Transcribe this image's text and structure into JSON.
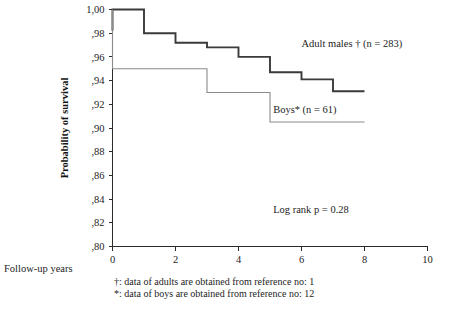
{
  "chart_data": {
    "type": "line",
    "subtype": "kaplan-meier-step",
    "title": "",
    "xlabel": "Follow-up years",
    "ylabel": "Probability of survival",
    "xlim": [
      0,
      10
    ],
    "ylim": [
      0.8,
      1.0
    ],
    "grid": false,
    "legend_position": "inline-annotations",
    "x_ticks": [
      0,
      2,
      4,
      6,
      8,
      10
    ],
    "x_tick_labels": [
      "0",
      "2",
      "4",
      "6",
      "8",
      "10"
    ],
    "y_ticks": [
      0.8,
      0.82,
      0.84,
      0.86,
      0.88,
      0.9,
      0.92,
      0.94,
      0.96,
      0.98,
      1.0
    ],
    "y_tick_labels": [
      ",80",
      ",82",
      ",84",
      ",86",
      ",88",
      ",90",
      ",92",
      ",94",
      ",96",
      ",98",
      "1,00"
    ],
    "decimal_separator": "comma",
    "series": [
      {
        "name": "Adult males",
        "label": "Adult males † (n = 283)",
        "n": 283,
        "footnote_marker": "†",
        "color": "#3a3a3a",
        "line_width": 1.9,
        "points": [
          {
            "x": 0.0,
            "y": 0.982
          },
          {
            "x": 0.0,
            "y": 1.0
          },
          {
            "x": 1.0,
            "y": 1.0
          },
          {
            "x": 1.0,
            "y": 0.98
          },
          {
            "x": 2.0,
            "y": 0.98
          },
          {
            "x": 2.0,
            "y": 0.972
          },
          {
            "x": 3.0,
            "y": 0.972
          },
          {
            "x": 3.0,
            "y": 0.968
          },
          {
            "x": 4.0,
            "y": 0.968
          },
          {
            "x": 4.0,
            "y": 0.96
          },
          {
            "x": 5.0,
            "y": 0.96
          },
          {
            "x": 5.0,
            "y": 0.947
          },
          {
            "x": 6.0,
            "y": 0.947
          },
          {
            "x": 6.0,
            "y": 0.941
          },
          {
            "x": 7.0,
            "y": 0.941
          },
          {
            "x": 7.0,
            "y": 0.931
          },
          {
            "x": 8.0,
            "y": 0.931
          }
        ]
      },
      {
        "name": "Boys",
        "label": "Boys* (n = 61)",
        "n": 61,
        "footnote_marker": "*",
        "color": "#8a8a8a",
        "line_width": 1.1,
        "points": [
          {
            "x": 0.0,
            "y": 1.0
          },
          {
            "x": 0.0,
            "y": 0.95
          },
          {
            "x": 3.0,
            "y": 0.95
          },
          {
            "x": 3.0,
            "y": 0.93
          },
          {
            "x": 5.0,
            "y": 0.93
          },
          {
            "x": 5.0,
            "y": 0.905
          },
          {
            "x": 8.0,
            "y": 0.905
          }
        ]
      }
    ],
    "annotations": [
      {
        "name": "adult-males-label",
        "text": "Adult males † (n = 283)",
        "x": 6.0,
        "y": 0.968
      },
      {
        "name": "boys-label",
        "text": "Boys* (n = 61)",
        "x": 5.1,
        "y": 0.913
      },
      {
        "name": "log-rank-label",
        "text": "Log rank p = 0.28",
        "x": 5.1,
        "y": 0.828
      }
    ],
    "statistics": {
      "log_rank_p_label": "Log rank p = 0.28",
      "log_rank_p": 0.28
    },
    "footnotes": [
      "†: data of adults are obtained from reference no: 1",
      "*: data of boys are obtained from reference no: 12"
    ]
  },
  "axes": {
    "y_title": "Probability of survival",
    "x_caption": "Follow-up years"
  }
}
